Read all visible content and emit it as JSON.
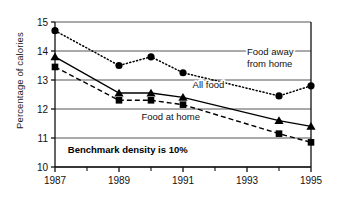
{
  "chart_data": {
    "type": "line",
    "title": "",
    "xlabel": "",
    "ylabel": "Percentage of calories",
    "xlim": [
      1987,
      1995
    ],
    "ylim": [
      10,
      15
    ],
    "ytick_labels": [
      "10",
      "11",
      "12",
      "13",
      "14",
      "15"
    ],
    "yticks": [
      10,
      11,
      12,
      13,
      14,
      15
    ],
    "xtick_labels": [
      "1987",
      "1989",
      "1991",
      "1993",
      "1995"
    ],
    "xticks": [
      1987,
      1989,
      1991,
      1993,
      1995
    ],
    "xticks_minor": [
      1988,
      1990,
      1992,
      1994
    ],
    "grid": "horizontal",
    "legend_position": "inline-annotations",
    "series": [
      {
        "name": "Food away from home",
        "marker": "circle",
        "line_style": "dotted",
        "x": [
          1987,
          1989,
          1990,
          1991,
          1994,
          1995
        ],
        "values": [
          14.7,
          13.5,
          13.8,
          13.25,
          12.45,
          12.8
        ]
      },
      {
        "name": "All food",
        "marker": "triangle",
        "line_style": "solid",
        "x": [
          1987,
          1989,
          1990,
          1991,
          1994,
          1995
        ],
        "values": [
          13.8,
          12.55,
          12.55,
          12.4,
          11.6,
          11.4
        ]
      },
      {
        "name": "Food at home",
        "marker": "square",
        "line_style": "dashed",
        "x": [
          1987,
          1989,
          1990,
          1991,
          1994,
          1995
        ],
        "values": [
          13.45,
          12.3,
          12.3,
          12.15,
          11.15,
          10.85
        ]
      }
    ],
    "annotations": [
      {
        "text": "Food away",
        "x": 1993.0,
        "y": 13.85,
        "bold": false
      },
      {
        "text": "from home",
        "x": 1993.0,
        "y": 13.45,
        "bold": false
      },
      {
        "text": "All food",
        "x": 1991.3,
        "y": 12.72,
        "bold": false
      },
      {
        "text": "Food at home",
        "x": 1989.7,
        "y": 11.62,
        "bold": false
      },
      {
        "text": "Benchmark density is 10%",
        "x": 1987.4,
        "y": 10.5,
        "bold": true
      }
    ]
  },
  "axis": {
    "y_title": "Percentage of calories",
    "y_ticks": [
      "15",
      "14",
      "13",
      "12",
      "11",
      "10"
    ],
    "x_ticks": [
      "1987",
      "1989",
      "1991",
      "1993",
      "1995"
    ]
  },
  "labels": {
    "food_away": "Food away",
    "from_home": "from home",
    "all_food": "All food",
    "food_at_home": "Food at home",
    "benchmark": "Benchmark density is 10%"
  },
  "colors": {
    "ink": "#000000",
    "grid": "#555555",
    "background": "#ffffff"
  }
}
